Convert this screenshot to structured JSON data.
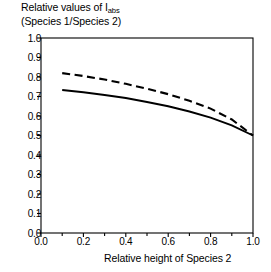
{
  "chart_data": {
    "type": "line",
    "title": "",
    "ylabel_line1_pre": "Relative values of I",
    "ylabel_line1_sub": "abs",
    "ylabel_line2": "(Species 1/Species 2)",
    "xlabel": "Relative height of Species 2",
    "xlim": [
      0.0,
      1.0
    ],
    "ylim": [
      0.0,
      1.0
    ],
    "grid": false,
    "legend": "none",
    "xticks": [
      "0.0",
      "0.2",
      "0.4",
      "0.6",
      "0.8",
      "1.0"
    ],
    "xtick_values": [
      0.0,
      0.2,
      0.4,
      0.6,
      0.8,
      1.0
    ],
    "xminor_values": [
      0.1,
      0.3,
      0.5,
      0.7,
      0.9
    ],
    "yticks": [
      "0.0",
      "0.1",
      "0.2",
      "0.3",
      "0.4",
      "0.5",
      "0.6",
      "0.7",
      "0.8",
      "0.9",
      "1.0"
    ],
    "ytick_values": [
      0.0,
      0.1,
      0.2,
      0.3,
      0.4,
      0.5,
      0.6,
      0.7,
      0.8,
      0.9,
      1.0
    ],
    "x": [
      0.1,
      0.2,
      0.3,
      0.4,
      0.5,
      0.6,
      0.7,
      0.8,
      0.9,
      1.0
    ],
    "series": [
      {
        "name": "upper-dashed",
        "style": "dashed",
        "values": [
          0.82,
          0.805,
          0.787,
          0.765,
          0.74,
          0.712,
          0.678,
          0.638,
          0.582,
          0.5
        ]
      },
      {
        "name": "lower-solid",
        "style": "solid",
        "values": [
          0.733,
          0.722,
          0.708,
          0.692,
          0.672,
          0.65,
          0.623,
          0.592,
          0.552,
          0.5
        ]
      }
    ]
  },
  "axes": {
    "frame_color": "#000000",
    "line_color": "#000000"
  }
}
